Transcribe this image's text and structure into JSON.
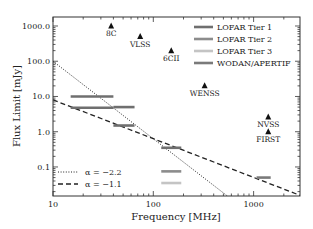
{
  "chart_data": {
    "type": "scatter",
    "title": "",
    "xlabel": "Frequency [MHz]",
    "ylabel": "Flux Limit [mJy]",
    "xscale": "log",
    "yscale": "log",
    "xlim": [
      10,
      2900
    ],
    "ylim": [
      0.015,
      1800
    ],
    "xticks": [
      {
        "value": 10,
        "label": "10"
      },
      {
        "value": 100,
        "label": "100"
      },
      {
        "value": 1000,
        "label": "1000"
      }
    ],
    "yticks": [
      {
        "value": 0.1,
        "label": "0.1"
      },
      {
        "value": 1,
        "label": "1.0"
      },
      {
        "value": 10,
        "label": "10.0"
      },
      {
        "value": 100,
        "label": "100.0"
      },
      {
        "value": 1000,
        "label": "1000.0"
      }
    ],
    "grid": false,
    "surveys": [
      {
        "name": "8C",
        "freq": 38,
        "flux": 1000
      },
      {
        "name": "VLSS",
        "freq": 74,
        "flux": 500
      },
      {
        "name": "6CII",
        "freq": 151,
        "flux": 200
      },
      {
        "name": "WENSS",
        "freq": 325,
        "flux": 20
      },
      {
        "name": "NVSS",
        "freq": 1400,
        "flux": 2.6
      },
      {
        "name": "FIRST",
        "freq": 1400,
        "flux": 1.0
      }
    ],
    "bands": [
      {
        "series": "LOFAR Tier 1",
        "fmin": 15,
        "fmax": 40,
        "flux": 10
      },
      {
        "series": "LOFAR Tier 1",
        "fmin": 15,
        "fmax": 40,
        "flux": 4.8
      },
      {
        "series": "LOFAR Tier 1",
        "fmin": 40,
        "fmax": 65,
        "flux": 5.0
      },
      {
        "series": "LOFAR Tier 1",
        "fmin": 40,
        "fmax": 65,
        "flux": 1.5
      },
      {
        "series": "LOFAR Tier 1",
        "fmin": 120,
        "fmax": 190,
        "flux": 0.35
      },
      {
        "series": "LOFAR Tier 2",
        "fmin": 120,
        "fmax": 190,
        "flux": 0.075
      },
      {
        "series": "LOFAR Tier 3",
        "fmin": 120,
        "fmax": 190,
        "flux": 0.035
      },
      {
        "series": "WODAN/APERTIF",
        "fmin": 1070,
        "fmax": 1480,
        "flux": 0.05
      }
    ],
    "series_colors": {
      "LOFAR Tier 1": "#6f6f6f",
      "LOFAR Tier 2": "#8c8c8c",
      "LOFAR Tier 3": "#c4c4c4",
      "WODAN/APERTIF": "#7a7a7a"
    },
    "legend_bands": {
      "position": "top-right",
      "entries": [
        "LOFAR Tier 1",
        "LOFAR Tier 2",
        "LOFAR Tier 3",
        "WODAN/APERTIF"
      ]
    },
    "lines": [
      {
        "name": "α = −2.2",
        "style": "dotted",
        "alpha": -2.2,
        "ref_freq": 10,
        "ref_flux": 100
      },
      {
        "name": "α = −1.1",
        "style": "dashed",
        "alpha": -1.1,
        "ref_freq": 10,
        "ref_flux": 8
      }
    ],
    "legend_lines": {
      "position": "bottom-left",
      "entries": [
        "α = −2.2",
        "α = −1.1"
      ]
    }
  }
}
